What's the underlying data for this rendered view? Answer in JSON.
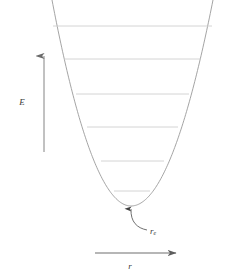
{
  "figure": {
    "background_color": "#ffffff"
  },
  "axes": {
    "vertical": {
      "label": "E",
      "icon": "up-arrow-icon",
      "color": "#808080",
      "x": 44,
      "y_bottom": 152,
      "y_top": 56,
      "label_x": 22,
      "label_y": 103
    },
    "horizontal": {
      "label": "r",
      "icon": "right-arrow-icon",
      "color": "#6e6e6e",
      "y": 253,
      "x_left": 95,
      "x_right": 176,
      "label_x": 130,
      "label_y": 267
    }
  },
  "curve": {
    "name": "potential-energy-curve",
    "shape": "parabola",
    "color": "#9a9a9a",
    "stroke_width": 0.9,
    "vertex_x": 131,
    "vertex_y": 206,
    "left_top_x": 52,
    "right_top_x": 213,
    "top_y": 0
  },
  "energy_levels": {
    "name": "vibrational-energy-levels",
    "count": 6,
    "color": "#c9c9c9",
    "stroke_width": 0.8,
    "levels": [
      {
        "n": 5,
        "y": 26,
        "x_left": 53,
        "x_right": 212
      },
      {
        "n": 4,
        "y": 59,
        "x_left": 64,
        "x_right": 201
      },
      {
        "n": 3,
        "y": 94,
        "x_left": 76,
        "x_right": 189
      },
      {
        "n": 2,
        "y": 127,
        "x_left": 87,
        "x_right": 178
      },
      {
        "n": 1,
        "y": 161,
        "x_left": 101,
        "x_right": 164
      },
      {
        "n": 0,
        "y": 191,
        "x_left": 114,
        "x_right": 150
      }
    ]
  },
  "annotation": {
    "name": "equilibrium-bond-length-annotation",
    "label_main": "r",
    "label_sub": "e",
    "label_x": 150,
    "label_y": 232,
    "color": "#4a4a4a",
    "arrow_tip_x": 131,
    "arrow_tip_y": 209,
    "arrow_tail_x": 147,
    "arrow_tail_y": 230,
    "icon": "curved-arrow-icon"
  },
  "chart_data": {
    "type": "line",
    "xlabel": "r",
    "ylabel": "E",
    "grid": false,
    "legend": null,
    "series": [
      {
        "name": "potential-energy-curve",
        "type": "parabola",
        "description": "V(r) proportional to (r - r_e)^2",
        "vertex": {
          "r": 131,
          "E": 206
        },
        "endpoints": [
          {
            "r": 52,
            "E": 0
          },
          {
            "r": 213,
            "E": 0
          }
        ]
      },
      {
        "name": "energy-levels",
        "type": "horizontal-lines",
        "values": [
          191,
          161,
          127,
          94,
          59,
          26
        ],
        "labels": [
          "v=0",
          "v=1",
          "v=2",
          "v=3",
          "v=4",
          "v=5"
        ]
      }
    ],
    "annotations": [
      {
        "text": "r_e",
        "x": 150,
        "y": 232,
        "points_to": {
          "x": 131,
          "y": 209
        }
      }
    ]
  }
}
